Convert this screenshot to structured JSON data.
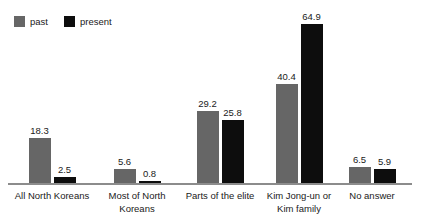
{
  "legend": {
    "position": "top-left",
    "items": [
      {
        "label": "past",
        "color": "#666666",
        "icon": "square-swatch"
      },
      {
        "label": "present",
        "color": "#0d0d0d",
        "icon": "square-swatch"
      }
    ]
  },
  "chart_data": {
    "type": "bar",
    "title": "",
    "subtitle": "",
    "xlabel": "",
    "ylabel": "",
    "grid": false,
    "legend_position": "top-left",
    "ylim": [
      0,
      70
    ],
    "categories": [
      "All North Koreans",
      "Most of North\nKoreans",
      "Parts of the elite",
      "Kim Jong-un or\nKim family",
      "No answer"
    ],
    "series": [
      {
        "name": "past",
        "color": "#666666",
        "values": [
          18.3,
          5.6,
          29.2,
          40.4,
          6.5
        ]
      },
      {
        "name": "present",
        "color": "#0d0d0d",
        "values": [
          2.5,
          0.8,
          25.8,
          64.9,
          5.9
        ]
      }
    ],
    "value_labels": [
      [
        "18.3",
        "2.5"
      ],
      [
        "5.6",
        "0.8"
      ],
      [
        "29.2",
        "25.8"
      ],
      [
        "40.4",
        "64.9"
      ],
      [
        "6.5",
        "5.9"
      ]
    ]
  },
  "axis": {
    "baseline_color": "#8c8c8c"
  }
}
